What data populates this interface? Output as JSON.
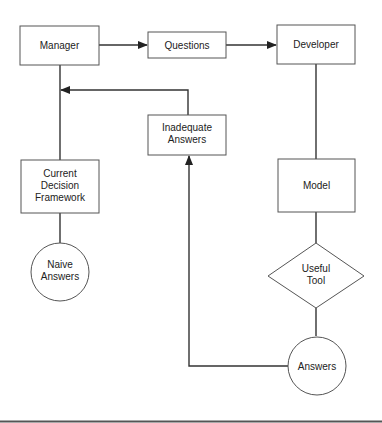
{
  "diagram": {
    "nodes": {
      "manager": {
        "label": [
          "Manager"
        ],
        "shape": "rectangle"
      },
      "questions": {
        "label": [
          "Questions"
        ],
        "shape": "rectangle"
      },
      "developer": {
        "label": [
          "Developer"
        ],
        "shape": "rectangle"
      },
      "inadequate_answers": {
        "label": [
          "Inadequate",
          "Answers"
        ],
        "shape": "rectangle"
      },
      "current_decision_framework": {
        "label": [
          "Current",
          "Decision",
          "Framework"
        ],
        "shape": "rectangle"
      },
      "model": {
        "label": [
          "Model"
        ],
        "shape": "rectangle"
      },
      "naive_answers": {
        "label": [
          "Naive",
          "Answers"
        ],
        "shape": "circle"
      },
      "useful_tool": {
        "label": [
          "Useful",
          "Tool"
        ],
        "shape": "diamond"
      },
      "answers": {
        "label": [
          "Answers"
        ],
        "shape": "circle"
      }
    },
    "edges": [
      {
        "from": "manager",
        "to": "questions",
        "arrow": true
      },
      {
        "from": "questions",
        "to": "developer",
        "arrow": true
      },
      {
        "from": "developer",
        "to": "model",
        "arrow": false
      },
      {
        "from": "model",
        "to": "useful_tool",
        "arrow": false
      },
      {
        "from": "useful_tool",
        "to": "answers",
        "arrow": false
      },
      {
        "from": "answers",
        "to": "inadequate_answers",
        "arrow": true
      },
      {
        "from": "inadequate_answers",
        "to": "manager",
        "arrow": true
      },
      {
        "from": "manager",
        "to": "current_decision_framework",
        "arrow": false
      },
      {
        "from": "current_decision_framework",
        "to": "naive_answers",
        "arrow": false
      }
    ]
  }
}
